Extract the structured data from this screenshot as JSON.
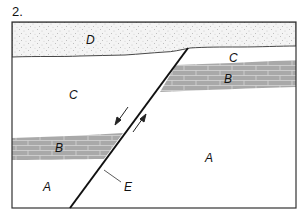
{
  "figure": {
    "number_label": "2.",
    "colors": {
      "frame": "#333333",
      "sandstone_fill": "#f4f4f4",
      "sandstone_dots": "#8a8a8a",
      "limestone_fill": "#a9a9a9",
      "limestone_mortar": "#d6d6d6",
      "fault": "#111111",
      "background": "#ffffff"
    },
    "layers": {
      "D": {
        "label": "D",
        "type": "sandstone"
      },
      "C_upper": {
        "label": "C",
        "type": "plain"
      },
      "C_left": {
        "label": "C",
        "type": "plain"
      },
      "B_right": {
        "label": "B",
        "type": "limestone"
      },
      "B_left": {
        "label": "B",
        "type": "limestone"
      },
      "A_left": {
        "label": "A",
        "type": "plain"
      },
      "A_right": {
        "label": "A",
        "type": "plain"
      }
    },
    "fault": {
      "label": "E",
      "motion": "left block down, right block up"
    }
  }
}
